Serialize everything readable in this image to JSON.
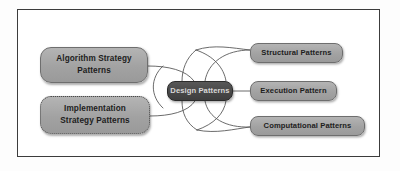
{
  "diagram": {
    "type": "mind-map",
    "frame": {
      "style": "solid-rule",
      "color": "#3c3c3c"
    },
    "palette": {
      "node_fill": "#a8a8a8",
      "node_border": "#6e6e6e",
      "node_text": "#1d1d1d",
      "center_fill": "#484848",
      "center_text": "#d8d8d8",
      "connector": "#5a5a5a",
      "frame": "#3c3c3c",
      "background": "#ffffff"
    },
    "center": {
      "id": "design-patterns",
      "label": "Design Patterns"
    },
    "left_nodes": [
      {
        "id": "algorithm-strategy-patterns",
        "label": "Algorithm Strategy\nPatterns",
        "border_style": "solid"
      },
      {
        "id": "implementation-strategy-patterns",
        "label": "Implementation\nStrategy Patterns",
        "border_style": "dotted"
      }
    ],
    "right_nodes": [
      {
        "id": "structural-patterns",
        "label": "Structural Patterns",
        "border_style": "solid"
      },
      {
        "id": "execution-pattern",
        "label": "Execution Pattern",
        "border_style": "solid"
      },
      {
        "id": "computational-patterns",
        "label": "Computational Patterns",
        "border_style": "solid"
      }
    ],
    "edges": [
      {
        "from": "algorithm-strategy-patterns",
        "to": "design-patterns",
        "style": "curve"
      },
      {
        "from": "implementation-strategy-patterns",
        "to": "design-patterns",
        "style": "curve"
      },
      {
        "from": "design-patterns",
        "to": "structural-patterns",
        "style": "curve"
      },
      {
        "from": "design-patterns",
        "to": "execution-pattern",
        "style": "straight"
      },
      {
        "from": "design-patterns",
        "to": "computational-patterns",
        "style": "curve"
      }
    ]
  }
}
